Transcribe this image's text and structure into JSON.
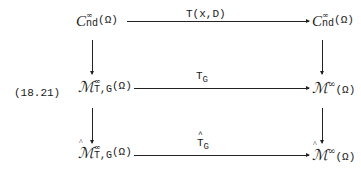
{
  "diagram": {
    "equation_number": "(18.21)",
    "nodes": {
      "top_left": {
        "symbol": "C",
        "sup": "∞",
        "sub": "nd",
        "arg": "(Ω)"
      },
      "top_right": {
        "symbol": "C",
        "sup": "∞",
        "sub": "nd",
        "arg": "(Ω)"
      },
      "mid_left": {
        "symbol": "ℳ",
        "sup": "∞",
        "sub": "T,G",
        "arg": "(Ω)"
      },
      "mid_right": {
        "symbol": "ℳ",
        "sup": "∞",
        "arg": "(Ω)"
      },
      "bot_left": {
        "symbol": "ℳ",
        "sup": "∞",
        "sub": "T,G",
        "arg": "(Ω)",
        "hat": true
      },
      "bot_right": {
        "symbol": "ℳ",
        "sup": "∞",
        "arg": "(Ω)",
        "hat": true
      }
    },
    "arrows": {
      "top": {
        "label": "T(x,D)"
      },
      "mid": {
        "label": "T",
        "label_sub": "G"
      },
      "bot": {
        "label": "T",
        "label_sub": "G",
        "hat": true
      }
    }
  }
}
